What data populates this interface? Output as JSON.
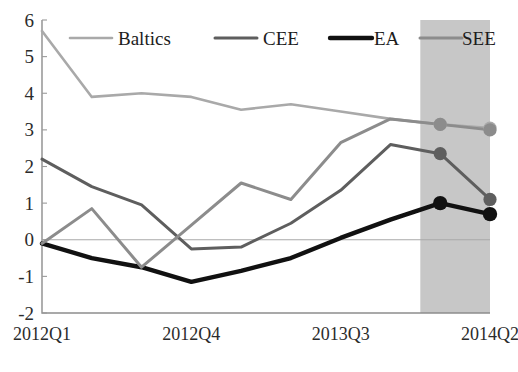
{
  "chart": {
    "type": "line",
    "title": "",
    "xlabel": "",
    "ylabel": "",
    "grid": false,
    "legend_position": "top-inside"
  },
  "axes": {
    "y_ticks": [
      "6",
      "5",
      "4",
      "3",
      "2",
      "1",
      "0",
      "-1",
      "-2"
    ],
    "y_min": -2,
    "y_max": 6,
    "x_ticks": [
      "2012Q1",
      "2012Q4",
      "2013Q3",
      "2014Q2"
    ],
    "x_tick_indices": [
      0,
      3,
      6,
      9
    ]
  },
  "legend": {
    "items": [
      {
        "label": "Baltics",
        "color": "#a9a9a9"
      },
      {
        "label": "CEE",
        "color": "#5e5e5e"
      },
      {
        "label": "EA",
        "color": "#111111"
      },
      {
        "label": "SEE",
        "color": "#8c8c8c"
      }
    ]
  },
  "forecast": {
    "label": "",
    "start_index": 7.6,
    "end_index": 9,
    "shade_color": "#a5a5a5"
  },
  "chart_data": {
    "type": "line",
    "title": "",
    "xlabel": "",
    "ylabel": "",
    "ylim": [
      -2,
      6
    ],
    "grid": false,
    "legend_position": "top-inside",
    "x": [
      "2012Q1",
      "2012Q2",
      "2012Q3",
      "2012Q4",
      "2013Q1",
      "2013Q2",
      "2013Q3",
      "2013Q4",
      "2014Q1",
      "2014Q2"
    ],
    "categories": [
      "2012Q1",
      "2012Q2",
      "2012Q3",
      "2012Q4",
      "2013Q1",
      "2013Q2",
      "2013Q3",
      "2013Q4",
      "2014Q1",
      "2014Q2"
    ],
    "series": [
      {
        "name": "Baltics",
        "color": "#a9a9a9",
        "values": [
          5.7,
          3.9,
          4.0,
          3.9,
          3.55,
          3.7,
          3.5,
          3.3,
          3.15,
          3.05
        ],
        "marker_indices": [
          8,
          9
        ]
      },
      {
        "name": "CEE",
        "color": "#5e5e5e",
        "values": [
          2.2,
          1.45,
          0.95,
          -0.25,
          -0.2,
          0.45,
          1.35,
          2.6,
          2.35,
          1.1
        ],
        "marker_indices": [
          8,
          9
        ]
      },
      {
        "name": "EA",
        "color": "#111111",
        "values": [
          -0.1,
          -0.5,
          -0.75,
          -1.15,
          -0.85,
          -0.5,
          0.05,
          0.55,
          1.0,
          0.7
        ],
        "marker_indices": [
          8,
          9
        ]
      },
      {
        "name": "SEE",
        "color": "#8c8c8c",
        "values": [
          -0.1,
          0.85,
          -0.75,
          0.4,
          1.55,
          1.1,
          2.65,
          3.3,
          3.15,
          3.0
        ],
        "marker_indices": [
          8,
          9
        ]
      }
    ],
    "shaded_forecast_region": {
      "from": "2013Q4+",
      "to": "2014Q2"
    },
    "annotations": []
  }
}
